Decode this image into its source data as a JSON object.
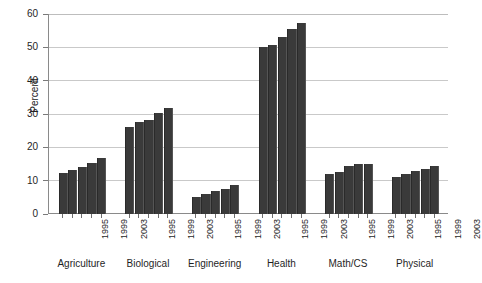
{
  "chart_data": {
    "type": "bar",
    "title": "",
    "xlabel": "",
    "ylabel": "Percent",
    "ylim": [
      0,
      60
    ],
    "yticks": [
      0,
      10,
      20,
      30,
      40,
      50,
      60
    ],
    "grid": true,
    "legend": "none",
    "bar_color": "#3a3a3a",
    "x": [
      "1995",
      "1996",
      "1997",
      "1998",
      "1999",
      "2000",
      "2001",
      "2002",
      "2003"
    ],
    "tick_labels": [
      "1995",
      "",
      "1999",
      "",
      "2003"
    ],
    "groups": [
      {
        "name": "Agriculture",
        "categories": [
          "1995",
          "1997",
          "1999",
          "2001",
          "2003"
        ],
        "values": [
          12.2,
          13.3,
          14.2,
          15.4,
          16.8
        ]
      },
      {
        "name": "Biological",
        "categories": [
          "1995",
          "1997",
          "1999",
          "2001",
          "2003"
        ],
        "values": [
          26.2,
          27.6,
          28.2,
          30.3,
          31.8
        ]
      },
      {
        "name": "Engineering",
        "categories": [
          "1995",
          "1997",
          "1999",
          "2001",
          "2003"
        ],
        "values": [
          5.2,
          6.1,
          7.0,
          7.5,
          8.8
        ]
      },
      {
        "name": "Health",
        "categories": [
          "1995",
          "1997",
          "1999",
          "2001",
          "2003"
        ],
        "values": [
          50.2,
          50.7,
          53.0,
          55.4,
          57.2
        ]
      },
      {
        "name": "Math/CS",
        "categories": [
          "1995",
          "1997",
          "1999",
          "2001",
          "2003"
        ],
        "values": [
          12.1,
          12.6,
          14.5,
          15.0,
          15.0
        ]
      },
      {
        "name": "Physical",
        "categories": [
          "1995",
          "1997",
          "1999",
          "2001",
          "2003"
        ],
        "values": [
          11.1,
          12.0,
          13.0,
          13.5,
          14.5
        ]
      }
    ]
  }
}
